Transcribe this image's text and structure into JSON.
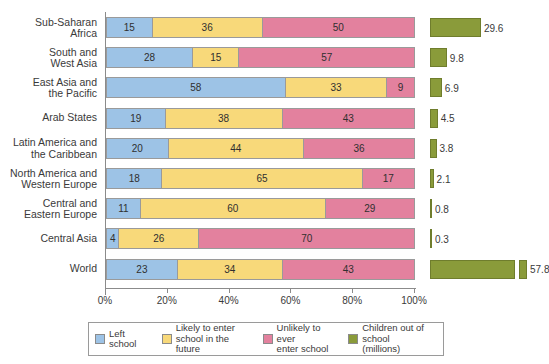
{
  "chart_data": {
    "type": "bar",
    "subtype": "stacked-horizontal-100-percent-with-secondary-bars",
    "title": "",
    "xlabel": "",
    "ylabel": "",
    "xlim": [
      0,
      100
    ],
    "xticks": [
      "0%",
      "20%",
      "40%",
      "60%",
      "80%",
      "100%"
    ],
    "xtick_values": [
      0,
      20,
      40,
      60,
      80,
      100
    ],
    "grid": false,
    "legend_position": "bottom",
    "categories": [
      "Sub-Saharan\nAfrica",
      "South and\nWest Asia",
      "East Asia and\nthe Pacific",
      "Arab States",
      "Latin America and\nthe Caribbean",
      "North America and\nWestern Europe",
      "Central and\nEastern Europe",
      "Central Asia",
      "World"
    ],
    "series": [
      {
        "name": "Left school",
        "color": "#9dc3e6",
        "values": [
          15,
          28,
          58,
          19,
          20,
          18,
          11,
          4,
          23
        ]
      },
      {
        "name": "Likely to enter\nschool in the future",
        "color": "#f8d97a",
        "values": [
          36,
          15,
          33,
          38,
          44,
          65,
          60,
          26,
          34
        ]
      },
      {
        "name": "Unlikely to ever\nenter school",
        "color": "#e3819e",
        "values": [
          50,
          57,
          9,
          43,
          36,
          17,
          29,
          70,
          43
        ]
      }
    ],
    "secondary_series": {
      "name": "Children out of\nschool (millions)",
      "color": "#8a9b3a",
      "unit": "millions",
      "values": [
        29.6,
        9.8,
        6.9,
        4.5,
        3.8,
        2.1,
        0.8,
        0.3,
        57.8
      ],
      "labels": [
        "29.6",
        "9.8",
        "6.9",
        "4.5",
        "3.8",
        "2.1",
        "0.8",
        "0.3",
        "57.8"
      ],
      "broken_axis_rows": [
        8
      ]
    },
    "legend": [
      {
        "label": "Left school",
        "color": "#9dc3e6"
      },
      {
        "label": "Likely to enter\nschool in the future",
        "color": "#f8d97a"
      },
      {
        "label": "Unlikely to ever\nenter school",
        "color": "#e3819e"
      },
      {
        "label": "Children out of\nschool (millions)",
        "color": "#8a9b3a"
      }
    ]
  }
}
